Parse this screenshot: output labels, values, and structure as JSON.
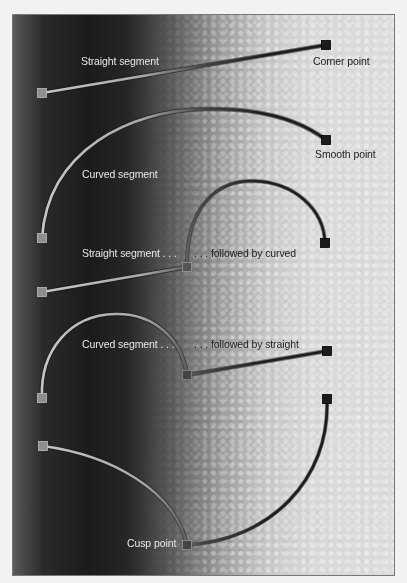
{
  "diagram": {
    "colors": {
      "page_background": "#f2f2f2",
      "frame_border": "#777777",
      "gradient_dark": "#1b1b1b",
      "gradient_light": "#dcdcdc",
      "label_light": "#e8e8e8",
      "label_dark": "#222222",
      "stroke_dark": "#1e1e1e",
      "stroke_light": "#c8c8c8",
      "anchor_fill": "#222222"
    },
    "labels": {
      "straight_segment": "Straight segment",
      "corner_point": "Corner point",
      "curved_segment": "Curved segment",
      "smooth_point": "Smooth point",
      "straight_segment_then": "Straight segment . . .",
      "followed_by_curved": ". . . followed by curved",
      "curved_segment_then": "Curved segment . . .",
      "followed_by_straight": ". . . followed by straight",
      "cusp_point": "Cusp point"
    },
    "examples": [
      {
        "name": "straight-segment",
        "anchors": [
          [
            42,
            93
          ],
          [
            326,
            45
          ]
        ],
        "segments": [
          "straight"
        ]
      },
      {
        "name": "curved-segment",
        "anchors": [
          [
            42,
            238
          ],
          [
            326,
            140
          ]
        ],
        "segments": [
          "curved"
        ]
      },
      {
        "name": "straight-then-curved",
        "anchors": [
          [
            42,
            292
          ],
          [
            187,
            267
          ],
          [
            325,
            243
          ]
        ],
        "segments": [
          "straight",
          "curved"
        ]
      },
      {
        "name": "curved-then-straight",
        "anchors": [
          [
            42,
            398
          ],
          [
            187,
            375
          ],
          [
            327,
            351
          ]
        ],
        "segments": [
          "curved",
          "straight"
        ]
      },
      {
        "name": "cusp",
        "anchors": [
          [
            43,
            446
          ],
          [
            187,
            545
          ],
          [
            327,
            399
          ]
        ],
        "segments": [
          "curved",
          "curved"
        ]
      }
    ]
  }
}
